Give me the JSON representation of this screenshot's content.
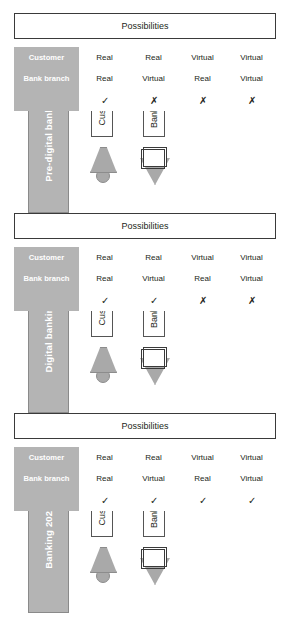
{
  "diagram": {
    "columns": [
      "Customer",
      "Bank branch",
      ""
    ],
    "actors": [
      {
        "key": "customer",
        "label": "Customer",
        "icon": "person-icon"
      },
      {
        "key": "branch",
        "label": "Bank branch",
        "icon": "bank-branch-icon"
      }
    ],
    "possibilities_label": "Possibilities",
    "colors": {
      "header_fill": "#b4b4b4",
      "banner_fill": "#b4b4b4",
      "banner_stroke": "#8a8a8a",
      "icon_fill": "#a9a9a9",
      "text": "#231f20",
      "banner_text": "#ffffff",
      "box_stroke": "#3a3a3a"
    },
    "marks": {
      "yes": "✓",
      "no": "✗"
    },
    "panels": [
      {
        "id": "banking-2020",
        "banner": "Banking 2020",
        "header_customer": "Customer",
        "header_branch": "Bank branch",
        "header_mark": "",
        "possibilities": "Possibilities",
        "rows": [
          {
            "customer": "Real",
            "branch": "Real",
            "mark": "✓"
          },
          {
            "customer": "Real",
            "branch": "Virtual",
            "mark": "✓"
          },
          {
            "customer": "Virtual",
            "branch": "Real",
            "mark": "✓"
          },
          {
            "customer": "Virtual",
            "branch": "Virtual",
            "mark": "✓"
          }
        ]
      },
      {
        "id": "digital-banking",
        "banner": "Digital banking",
        "header_customer": "Customer",
        "header_branch": "Bank branch",
        "header_mark": "",
        "possibilities": "Possibilities",
        "rows": [
          {
            "customer": "Real",
            "branch": "Real",
            "mark": "✓"
          },
          {
            "customer": "Real",
            "branch": "Virtual",
            "mark": "✓"
          },
          {
            "customer": "Virtual",
            "branch": "Real",
            "mark": "✗"
          },
          {
            "customer": "Virtual",
            "branch": "Virtual",
            "mark": "✗"
          }
        ]
      },
      {
        "id": "pre-digital-banking",
        "banner": "Pre-digital banking",
        "header_customer": "Customer",
        "header_branch": "Bank branch",
        "header_mark": "",
        "possibilities": "Possibilities",
        "rows": [
          {
            "customer": "Real",
            "branch": "Real",
            "mark": "✓"
          },
          {
            "customer": "Real",
            "branch": "Virtual",
            "mark": "✗"
          },
          {
            "customer": "Virtual",
            "branch": "Real",
            "mark": "✗"
          },
          {
            "customer": "Virtual",
            "branch": "Virtual",
            "mark": "✗"
          }
        ]
      }
    ]
  }
}
